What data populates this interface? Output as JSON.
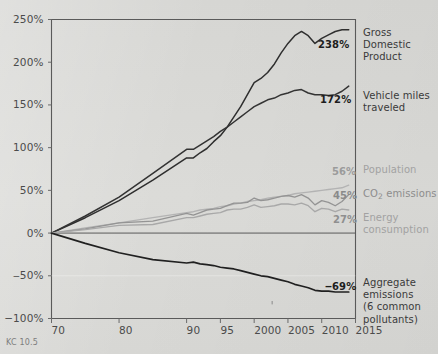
{
  "caption": "KC 10.5",
  "axes": {
    "y_ticks": [
      "250%",
      "200%",
      "150%",
      "100%",
      "50%",
      "0%",
      "‒50%",
      "−100%"
    ],
    "x_ticks": [
      "70",
      "80",
      "90",
      "95",
      "2000",
      "2005",
      "2010",
      "2015"
    ]
  },
  "legend": {
    "gdp": "Gross\nDomestic\nProduct",
    "vmt": "Vehicle miles\ntraveled",
    "population": "Population",
    "co2": "CO2 emissions",
    "energy": "Energy\nconsumption",
    "aggregate": "Aggregate\nemissions\n(6 common\npollutants)"
  },
  "value_labels": {
    "gdp": "238%",
    "vmt": "172%",
    "population": "56%",
    "co2": "45%",
    "energy": "27%",
    "aggregate": "‒69%"
  },
  "colors": {
    "background": "#d8d8d6",
    "axis": "#5a5a5a",
    "gdp": "#2e2e2e",
    "vmt": "#333333",
    "aggregate": "#202020",
    "population": "#b3b3b3",
    "co2": "#949494",
    "energy": "#a8a8a8"
  },
  "chart_data": {
    "type": "line",
    "title": "",
    "xlabel": "",
    "ylabel": "",
    "xlim": [
      1970,
      2015
    ],
    "ylim": [
      -100,
      250
    ],
    "grid": false,
    "legend_position": "right",
    "x": [
      1970,
      1975,
      1980,
      1985,
      1990,
      1991,
      1992,
      1993,
      1994,
      1995,
      1996,
      1997,
      1998,
      1999,
      2000,
      2001,
      2002,
      2003,
      2004,
      2005,
      2006,
      2007,
      2008,
      2009,
      2010,
      2011,
      2012,
      2013,
      2014
    ],
    "series": [
      {
        "name": "Gross Domestic Product",
        "label": "238%",
        "color": "#2e2e2e",
        "values": [
          0,
          18,
          38,
          62,
          88,
          88,
          94,
          99,
          107,
          114,
          124,
          136,
          148,
          162,
          176,
          181,
          188,
          198,
          211,
          222,
          231,
          236,
          231,
          222,
          228,
          232,
          236,
          238,
          238
        ]
      },
      {
        "name": "Vehicle miles traveled",
        "label": "172%",
        "color": "#333333",
        "values": [
          0,
          20,
          42,
          70,
          98,
          98,
          103,
          108,
          113,
          119,
          124,
          130,
          136,
          142,
          148,
          152,
          156,
          158,
          162,
          164,
          167,
          168,
          164,
          162,
          162,
          161,
          162,
          166,
          172
        ]
      },
      {
        "name": "Population",
        "label": "56%",
        "color": "#b3b3b3",
        "values": [
          0,
          6,
          12,
          18,
          24,
          25,
          27,
          28,
          29,
          31,
          32,
          34,
          35,
          37,
          38,
          39,
          41,
          42,
          43,
          44,
          46,
          47,
          48,
          49,
          50,
          51,
          52,
          53,
          56
        ]
      },
      {
        "name": "CO2 emissions",
        "label": "45%",
        "color": "#949494",
        "values": [
          0,
          5,
          12,
          14,
          23,
          21,
          24,
          27,
          28,
          29,
          32,
          35,
          35,
          36,
          41,
          38,
          39,
          41,
          43,
          44,
          42,
          45,
          41,
          33,
          38,
          36,
          32,
          37,
          45
        ]
      },
      {
        "name": "Energy consumption",
        "label": "27%",
        "color": "#a8a8a8",
        "values": [
          0,
          4,
          9,
          10,
          18,
          18,
          20,
          22,
          23,
          24,
          27,
          28,
          28,
          30,
          33,
          30,
          31,
          32,
          34,
          34,
          33,
          35,
          32,
          25,
          29,
          28,
          25,
          28,
          27
        ]
      },
      {
        "name": "Aggregate emissions (6 common pollutants)",
        "label": "‒69%",
        "color": "#202020",
        "values": [
          0,
          -12,
          -23,
          -31,
          -35,
          -34,
          -36,
          -37,
          -38,
          -40,
          -41,
          -42,
          -44,
          -46,
          -48,
          -50,
          -51,
          -53,
          -55,
          -57,
          -60,
          -62,
          -64,
          -67,
          -68,
          -68,
          -69,
          -69,
          -69
        ]
      }
    ]
  }
}
